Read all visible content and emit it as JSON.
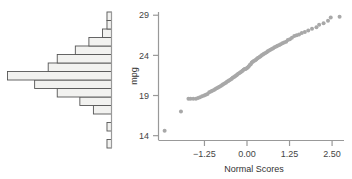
{
  "figure": {
    "title": "",
    "panels": [
      "histogram",
      "normal-qq-plot"
    ]
  },
  "colors": {
    "point": "#a8a8a8",
    "axis": "#999999",
    "bar_fill": "#f2f2f0",
    "bar_stroke": "#555555",
    "text": "#444444",
    "background": "#ffffff"
  },
  "chart_data": [
    {
      "type": "bar",
      "id": "histogram",
      "orientation": "horizontal-left",
      "title": "",
      "xlabel": "",
      "ylabel": "",
      "grid": false,
      "legend": null,
      "note": "Horizontal histogram of mpg, bars extend leftward from a vertical baseline axis; bins ascend from mpg 14 at bottom to mpg 29+ at top",
      "categories": [
        "13.5-14.5",
        "14.5-15.5",
        "15.5-16.5",
        "16.5-17.5",
        "17.5-18.5",
        "18.5-19.5",
        "19.5-20.5",
        "20.5-21.5",
        "21.5-22.5",
        "22.5-23.5",
        "23.5-24.5",
        "24.5-25.5",
        "25.5-26.5",
        "26.5-27.5",
        "27.5-28.5",
        "28.5-29.5"
      ],
      "values": [
        1,
        0,
        1,
        0,
        4,
        7,
        12,
        17,
        23,
        14,
        12,
        8,
        5,
        2,
        1,
        1
      ],
      "xlim": [
        0,
        24
      ],
      "ylim": [
        13.5,
        29.5
      ],
      "tick_labels_y": [
        "14",
        "19",
        "24",
        "29"
      ]
    },
    {
      "type": "scatter",
      "id": "normal-qq-plot",
      "title": "",
      "xlabel": "Normal Scores",
      "ylabel": "mpg",
      "grid": false,
      "legend": null,
      "xlim": [
        -2.6,
        2.85
      ],
      "ylim": [
        13.4,
        29.4
      ],
      "xticks": [
        -1.25,
        0.0,
        1.25,
        2.5
      ],
      "xtick_labels": [
        "-1.25",
        "0.00",
        "1.25",
        "2.50"
      ],
      "yticks": [
        14,
        19,
        24,
        29
      ],
      "ytick_labels": [
        "14",
        "19",
        "24",
        "29"
      ],
      "points": [
        [
          -2.42,
          14.6
        ],
        [
          -1.94,
          17.0
        ],
        [
          -1.72,
          18.6
        ],
        [
          -1.66,
          18.6
        ],
        [
          -1.58,
          18.6
        ],
        [
          -1.5,
          18.6
        ],
        [
          -1.44,
          18.7
        ],
        [
          -1.38,
          18.8
        ],
        [
          -1.32,
          18.9
        ],
        [
          -1.26,
          19.0
        ],
        [
          -1.21,
          19.1
        ],
        [
          -1.16,
          19.2
        ],
        [
          -1.11,
          19.4
        ],
        [
          -1.06,
          19.5
        ],
        [
          -1.02,
          19.6
        ],
        [
          -0.97,
          19.7
        ],
        [
          -0.93,
          19.8
        ],
        [
          -0.89,
          19.9
        ],
        [
          -0.85,
          20.0
        ],
        [
          -0.81,
          20.1
        ],
        [
          -0.77,
          20.2
        ],
        [
          -0.73,
          20.3
        ],
        [
          -0.7,
          20.4
        ],
        [
          -0.66,
          20.5
        ],
        [
          -0.62,
          20.6
        ],
        [
          -0.59,
          20.7
        ],
        [
          -0.55,
          20.8
        ],
        [
          -0.52,
          20.9
        ],
        [
          -0.48,
          21.0
        ],
        [
          -0.45,
          21.1
        ],
        [
          -0.42,
          21.2
        ],
        [
          -0.38,
          21.3
        ],
        [
          -0.35,
          21.4
        ],
        [
          -0.32,
          21.5
        ],
        [
          -0.29,
          21.6
        ],
        [
          -0.26,
          21.7
        ],
        [
          -0.22,
          21.8
        ],
        [
          -0.19,
          21.9
        ],
        [
          -0.16,
          22.0
        ],
        [
          -0.13,
          22.1
        ],
        [
          -0.1,
          22.2
        ],
        [
          -0.07,
          22.3
        ],
        [
          -0.04,
          22.3
        ],
        [
          -0.01,
          22.4
        ],
        [
          0.02,
          22.5
        ],
        [
          0.05,
          22.6
        ],
        [
          0.08,
          22.8
        ],
        [
          0.11,
          22.9
        ],
        [
          0.14,
          23.1
        ],
        [
          0.17,
          23.2
        ],
        [
          0.2,
          23.3
        ],
        [
          0.24,
          23.4
        ],
        [
          0.27,
          23.5
        ],
        [
          0.3,
          23.6
        ],
        [
          0.33,
          23.7
        ],
        [
          0.37,
          23.8
        ],
        [
          0.4,
          23.9
        ],
        [
          0.43,
          24.0
        ],
        [
          0.47,
          24.1
        ],
        [
          0.5,
          24.2
        ],
        [
          0.54,
          24.3
        ],
        [
          0.58,
          24.4
        ],
        [
          0.61,
          24.5
        ],
        [
          0.65,
          24.6
        ],
        [
          0.69,
          24.7
        ],
        [
          0.73,
          24.8
        ],
        [
          0.77,
          24.9
        ],
        [
          0.81,
          25.0
        ],
        [
          0.86,
          25.1
        ],
        [
          0.9,
          25.2
        ],
        [
          0.95,
          25.3
        ],
        [
          0.99,
          25.4
        ],
        [
          1.04,
          25.5
        ],
        [
          1.09,
          25.6
        ],
        [
          1.15,
          25.7
        ],
        [
          1.2,
          25.9
        ],
        [
          1.26,
          26.0
        ],
        [
          1.32,
          26.2
        ],
        [
          1.39,
          26.4
        ],
        [
          1.46,
          26.5
        ],
        [
          1.53,
          26.6
        ],
        [
          1.61,
          26.8
        ],
        [
          1.7,
          26.9
        ],
        [
          1.8,
          27.1
        ],
        [
          1.91,
          27.3
        ],
        [
          2.04,
          27.5
        ],
        [
          2.12,
          27.8
        ],
        [
          2.25,
          28.0
        ],
        [
          2.38,
          28.3
        ],
        [
          2.46,
          28.7
        ],
        [
          2.72,
          28.8
        ]
      ]
    }
  ]
}
